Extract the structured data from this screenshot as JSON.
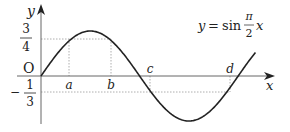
{
  "figure": {
    "equation": {
      "lhs": "y",
      "equals": "=",
      "func": "sin",
      "frac_num": "π",
      "frac_den": "2",
      "var": "x"
    },
    "axes": {
      "x_label": "x",
      "y_label": "y",
      "origin_label": "O"
    },
    "y_ticks": [
      {
        "sign": "",
        "num": "3",
        "den": "4"
      },
      {
        "sign": "−",
        "num": "1",
        "den": "3"
      }
    ],
    "x_points": [
      "a",
      "b",
      "c",
      "d"
    ],
    "colors": {
      "curve": "#222222",
      "axis": "#555555",
      "guide": "#888888"
    }
  }
}
